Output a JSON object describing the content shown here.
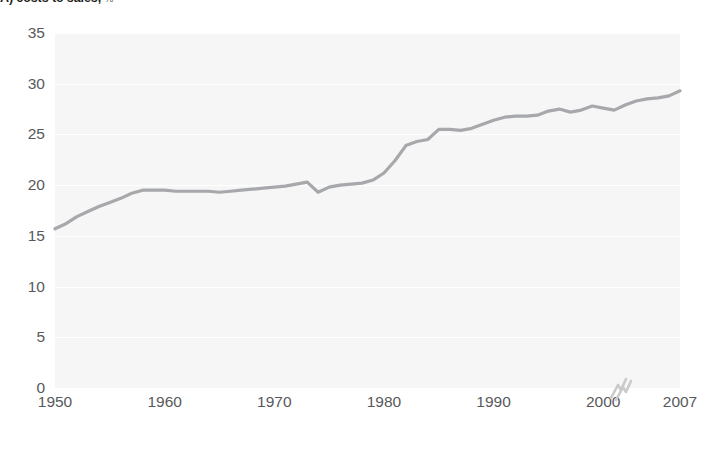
{
  "panel": {
    "label": "A) costs to sales,",
    "unit": "%"
  },
  "axes": {
    "y_ticks": [
      "0",
      "5",
      "10",
      "15",
      "20",
      "25",
      "30",
      "35"
    ],
    "x_ticks": [
      "1950",
      "1960",
      "1970",
      "1980",
      "1990",
      "2000",
      "2007"
    ],
    "axis_break_icon": "axis-break-squiggle"
  },
  "colors": {
    "line": "#a6a8ab",
    "plot_background": "#f6f6f6",
    "gridline": "#ffffff",
    "tick_text": "#58595b",
    "title_text": "#231f20"
  },
  "chart_data": {
    "type": "line",
    "title": "A) costs to sales, %",
    "xlabel": "",
    "ylabel": "",
    "ylim": [
      0,
      35
    ],
    "xlim": [
      1950,
      2007
    ],
    "ytick_interval": 5,
    "grid": true,
    "legend_position": "none",
    "axis_break": {
      "between": [
        2000,
        2007
      ],
      "symbol": "squiggle"
    },
    "series": [
      {
        "name": "costs to sales",
        "x": [
          1950,
          1951,
          1952,
          1953,
          1954,
          1955,
          1956,
          1957,
          1958,
          1959,
          1960,
          1961,
          1962,
          1963,
          1964,
          1965,
          1966,
          1967,
          1968,
          1969,
          1970,
          1971,
          1972,
          1973,
          1974,
          1975,
          1976,
          1977,
          1978,
          1979,
          1980,
          1981,
          1982,
          1983,
          1984,
          1985,
          1986,
          1987,
          1988,
          1989,
          1990,
          1991,
          1992,
          1993,
          1994,
          1995,
          1996,
          1997,
          1998,
          1999,
          2000,
          2001,
          2002,
          2003,
          2004,
          2005,
          2006,
          2007
        ],
        "values": [
          15.7,
          16.2,
          16.9,
          17.4,
          17.9,
          18.3,
          18.7,
          19.2,
          19.5,
          19.5,
          19.5,
          19.4,
          19.4,
          19.4,
          19.4,
          19.3,
          19.4,
          19.5,
          19.6,
          19.7,
          19.8,
          19.9,
          20.1,
          20.3,
          19.3,
          19.8,
          20.0,
          20.1,
          20.2,
          20.5,
          21.2,
          22.4,
          23.9,
          24.3,
          24.5,
          25.5,
          25.5,
          25.4,
          25.6,
          26.0,
          26.4,
          26.7,
          26.8,
          26.8,
          26.9,
          27.3,
          27.5,
          27.2,
          27.4,
          27.8,
          27.6,
          27.4,
          27.9,
          28.3,
          28.5,
          28.6,
          28.8,
          29.3
        ]
      }
    ]
  }
}
